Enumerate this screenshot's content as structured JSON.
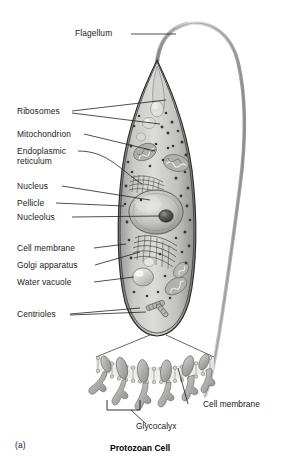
{
  "figure": {
    "panel_letter": "(a)",
    "caption": "Protozoan Cell"
  },
  "labels": {
    "flagellum": "Flagellum",
    "ribosomes": "Ribosomes",
    "mitochondrion": "Mitochondrion",
    "endoplasmic_reticulum_line1": "Endoplasmic",
    "endoplasmic_reticulum_line2": "reticulum",
    "nucleus": "Nucleus",
    "pellicle": "Pellicle",
    "nucleolus": "Nucleolus",
    "cell_membrane": "Cell membrane",
    "golgi_apparatus": "Golgi apparatus",
    "water_vacuole": "Water vacuole",
    "centrioles": "Centrioles"
  },
  "inset": {
    "title_glycocalyx": "Glycocalyx",
    "title_cell_membrane": "Cell membrane"
  },
  "colors": {
    "outline": "#2b2b2b",
    "leader": "#222222",
    "cytoplasm_light": "#d8d8d6",
    "cytoplasm_mid": "#b9b9b7",
    "cytoplasm_dark": "#8f8f8d",
    "organelle": "#9a9a98",
    "nucleus": "#c2c2c0",
    "nucleolus": "#4a4a48",
    "ribosome_dot": "#3c3c3a",
    "membrane_gray": "#a8a8a6",
    "text": "#1a1a1a"
  }
}
